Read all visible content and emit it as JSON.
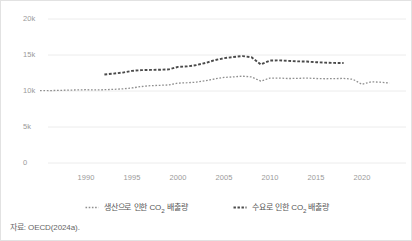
{
  "chart_data": {
    "type": "line",
    "title": "",
    "subtitle": "",
    "xlabel": "",
    "ylabel": "",
    "xlim": [
      1985,
      2024
    ],
    "ylim": [
      0,
      20000
    ],
    "grid": true,
    "y_ticks": [
      0,
      5000,
      10000,
      15000,
      20000
    ],
    "y_tick_labels": [
      "0",
      "5k",
      "10k",
      "15k",
      "20k"
    ],
    "x_ticks": [
      1990,
      1995,
      2000,
      2005,
      2010,
      2015,
      2020
    ],
    "x_tick_labels": [
      "1990",
      "1995",
      "2000",
      "2005",
      "2010",
      "2015",
      "2020"
    ],
    "legend_position": "bottom",
    "series": [
      {
        "name": "생산으로 인한 CO2 배출량",
        "style": "dotted",
        "color": "#8f8f8f",
        "x": [
          1985,
          1986,
          1987,
          1988,
          1989,
          1990,
          1991,
          1992,
          1993,
          1994,
          1995,
          1996,
          1997,
          1998,
          1999,
          2000,
          2001,
          2002,
          2003,
          2004,
          2005,
          2006,
          2007,
          2008,
          2009,
          2010,
          2011,
          2012,
          2013,
          2014,
          2015,
          2016,
          2017,
          2018,
          2019,
          2020,
          2021,
          2022,
          2023
        ],
        "values": [
          10050,
          10060,
          10080,
          10120,
          10150,
          10180,
          10150,
          10180,
          10230,
          10300,
          10420,
          10620,
          10740,
          10790,
          10840,
          11100,
          11150,
          11230,
          11420,
          11680,
          11880,
          11960,
          12060,
          11950,
          11370,
          11800,
          11800,
          11730,
          11760,
          11790,
          11740,
          11700,
          11720,
          11750,
          11630,
          10930,
          11280,
          11220,
          11100
        ]
      },
      {
        "name": "수요로 인한 CO2 배출량",
        "style": "dashed",
        "color": "#4a4a4a",
        "x": [
          1992,
          1993,
          1994,
          1995,
          1996,
          1997,
          1998,
          1999,
          2000,
          2001,
          2002,
          2003,
          2004,
          2005,
          2006,
          2007,
          2008,
          2009,
          2010,
          2011,
          2012,
          2013,
          2014,
          2015,
          2016,
          2017,
          2018
        ],
        "values": [
          12300,
          12420,
          12560,
          12800,
          12900,
          12930,
          12950,
          13000,
          13350,
          13420,
          13600,
          13900,
          14280,
          14560,
          14720,
          14850,
          14680,
          13680,
          14230,
          14250,
          14180,
          14120,
          14090,
          14000,
          13940,
          13900,
          13880
        ]
      }
    ]
  },
  "legend": {
    "items": [
      {
        "label_pre": "생산으로 인한 CO",
        "label_sub": "2",
        "label_post": " 배출량"
      },
      {
        "label_pre": "수요로 인한 CO",
        "label_sub": "2",
        "label_post": " 배출량"
      }
    ]
  },
  "source": {
    "text": "자료: OECD(2024a)."
  }
}
